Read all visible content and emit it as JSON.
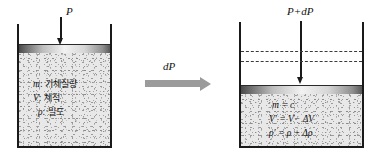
{
  "figure": {
    "background_color": "#ffffff"
  },
  "left_state": {
    "pressure_label": "P",
    "properties": [
      {
        "symbol": "m",
        "separator": ":",
        "description": "기체질량"
      },
      {
        "symbol": "V",
        "separator": ":",
        "description": "체적"
      },
      {
        "symbol": "ρ",
        "separator": ":",
        "description": "밀도"
      }
    ]
  },
  "process": {
    "label": "dP",
    "arrow_direction": "right",
    "arrow_color": "#9b9b9b"
  },
  "right_state": {
    "pressure_label": "P+dP",
    "equations": [
      "m  = c",
      "V′ = V− ΔV",
      "ρ′ = ρ + Δρ"
    ],
    "dashed_reference_lines": 2
  },
  "colors": {
    "outline": "#1a1a1a",
    "gas_fill": "#e8e8e8",
    "piston_light": "#f2f2f2",
    "piston_dark": "#4a4a4a",
    "arrow_gray": "#9b9b9b"
  }
}
